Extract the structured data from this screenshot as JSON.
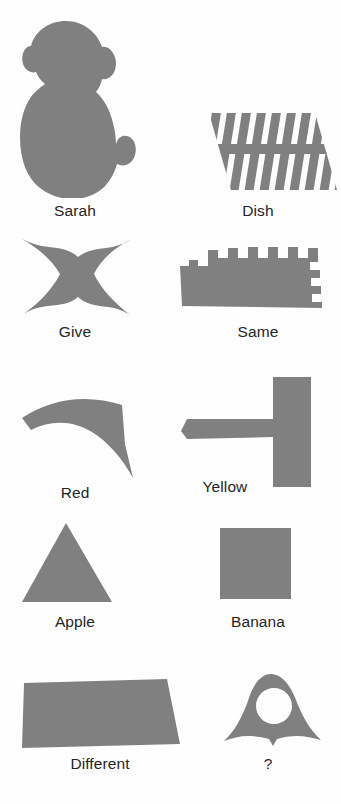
{
  "figure": {
    "name": "sarah-plastic-token-lexicon",
    "background_color": "#fefefe",
    "token_fill_color": "#808080",
    "label_color": "#252525",
    "tokens": [
      {
        "label": "Sarah",
        "shape_name": "monkey-silhouette-token",
        "row": 1,
        "column": 1
      },
      {
        "label": "Dish",
        "shape_name": "striped-parallelogram-token",
        "row": 1,
        "column": 2
      },
      {
        "label": "Give",
        "shape_name": "bowtie-token",
        "row": 2,
        "column": 1
      },
      {
        "label": "Same",
        "shape_name": "castellated-block-token",
        "row": 2,
        "column": 2
      },
      {
        "label": "Red",
        "shape_name": "curved-chevron-token",
        "row": 3,
        "column": 1
      },
      {
        "label": "Yellow",
        "shape_name": "rotated-tee-token",
        "row": 3,
        "column": 2
      },
      {
        "label": "Apple",
        "shape_name": "triangle-token",
        "row": 4,
        "column": 1
      },
      {
        "label": "Banana",
        "shape_name": "square-token",
        "row": 4,
        "column": 2
      },
      {
        "label": "Different",
        "shape_name": "quadrilateral-token",
        "row": 5,
        "column": 1
      },
      {
        "label": "?",
        "shape_name": "bell-with-hole-token",
        "row": 5,
        "column": 2
      }
    ]
  }
}
